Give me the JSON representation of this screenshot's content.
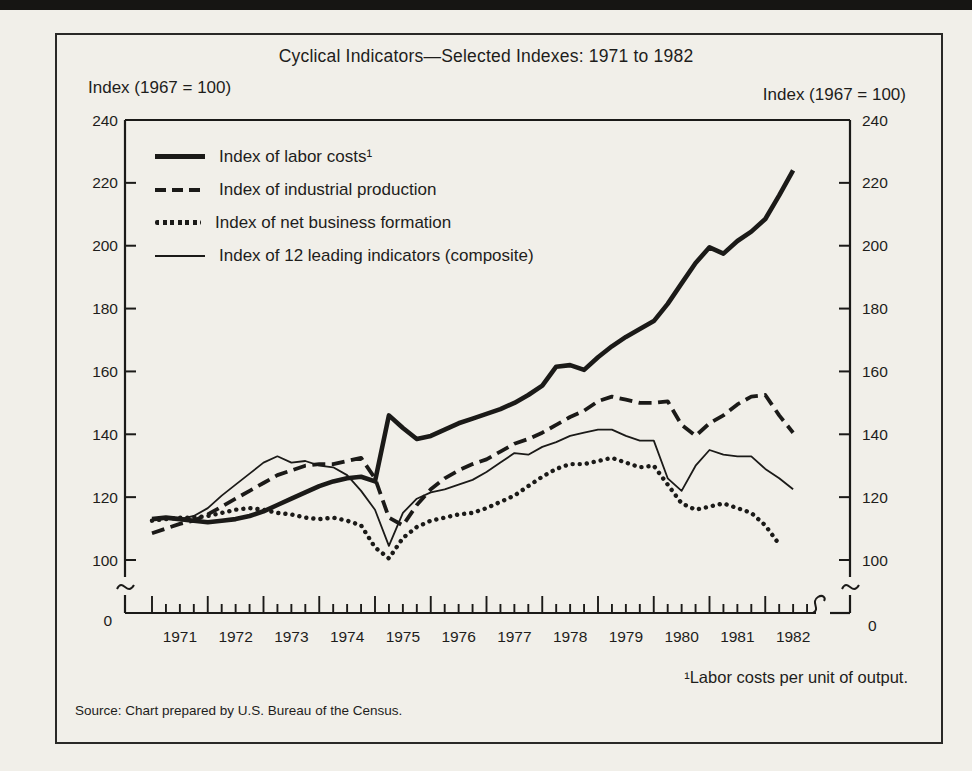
{
  "ink_color": "#1b1a18",
  "paper_color": "#f1efe9",
  "chart": {
    "title": "Cyclical Indicators—Selected Indexes: 1971 to 1982",
    "left_axis_title": "Index (1967 = 100)",
    "right_axis_title": "Index (1967 = 100)",
    "footnote": "¹Labor costs per unit of output.",
    "source": "Source: Chart prepared by U.S. Bureau of the Census."
  },
  "chart_data": {
    "type": "line",
    "title": "Cyclical Indicators—Selected Indexes: 1971 to 1982",
    "ylabel_left": "Index (1967 = 100)",
    "ylabel_right": "Index (1967 = 100)",
    "ylim": [
      100,
      240
    ],
    "y_ticks": [
      100,
      120,
      140,
      160,
      180,
      200,
      220,
      240
    ],
    "broken_y_axis_to_zero": true,
    "zero_label": "0",
    "x_tick_years": [
      "1971",
      "1972",
      "1973",
      "1974",
      "1975",
      "1976",
      "1977",
      "1978",
      "1979",
      "1980",
      "1981",
      "1982"
    ],
    "x_minor_ticks": "quarterly",
    "legend_position": "top-left",
    "grid": false,
    "series": [
      {
        "id": "labor-costs",
        "name": "Index of labor costs¹",
        "style": "thick-solid",
        "x_unit": "year-quarterly",
        "values": [
          [
            1971.0,
            113
          ],
          [
            1971.25,
            113.5
          ],
          [
            1971.5,
            113
          ],
          [
            1971.75,
            112.5
          ],
          [
            1972.0,
            112
          ],
          [
            1972.25,
            112.5
          ],
          [
            1972.5,
            113
          ],
          [
            1972.75,
            114
          ],
          [
            1973.0,
            115.5
          ],
          [
            1973.25,
            117.5
          ],
          [
            1973.5,
            119.5
          ],
          [
            1973.75,
            121.5
          ],
          [
            1974.0,
            123.5
          ],
          [
            1974.25,
            125
          ],
          [
            1974.5,
            126
          ],
          [
            1974.75,
            126.5
          ],
          [
            1975.0,
            125
          ],
          [
            1975.25,
            146
          ],
          [
            1975.5,
            142
          ],
          [
            1975.75,
            138.5
          ],
          [
            1976.0,
            139.5
          ],
          [
            1976.25,
            141.5
          ],
          [
            1976.5,
            143.5
          ],
          [
            1976.75,
            145
          ],
          [
            1977.0,
            146.5
          ],
          [
            1977.25,
            148
          ],
          [
            1977.5,
            150
          ],
          [
            1977.75,
            152.5
          ],
          [
            1978.0,
            155.5
          ],
          [
            1978.25,
            161.5
          ],
          [
            1978.5,
            162
          ],
          [
            1978.75,
            160.5
          ],
          [
            1979.0,
            164.5
          ],
          [
            1979.25,
            168
          ],
          [
            1979.5,
            171
          ],
          [
            1979.75,
            173.5
          ],
          [
            1980.0,
            176
          ],
          [
            1980.25,
            181.5
          ],
          [
            1980.5,
            188
          ],
          [
            1980.75,
            194.5
          ],
          [
            1981.0,
            199.5
          ],
          [
            1981.25,
            197.5
          ],
          [
            1981.5,
            201.5
          ],
          [
            1981.75,
            204.5
          ],
          [
            1982.0,
            208.5
          ],
          [
            1982.25,
            216
          ],
          [
            1982.5,
            224
          ]
        ]
      },
      {
        "id": "industrial-production",
        "name": "Index of industrial production",
        "style": "dashed",
        "x_unit": "year-quarterly",
        "values": [
          [
            1971.0,
            108.5
          ],
          [
            1971.25,
            110
          ],
          [
            1971.5,
            111.5
          ],
          [
            1971.75,
            112.5
          ],
          [
            1972.0,
            114.5
          ],
          [
            1972.25,
            117
          ],
          [
            1972.5,
            119.5
          ],
          [
            1972.75,
            122
          ],
          [
            1973.0,
            124.5
          ],
          [
            1973.25,
            127
          ],
          [
            1973.5,
            128.5
          ],
          [
            1973.75,
            130
          ],
          [
            1974.0,
            130.5
          ],
          [
            1974.25,
            130.5
          ],
          [
            1974.5,
            131.5
          ],
          [
            1974.75,
            132.5
          ],
          [
            1975.0,
            126
          ],
          [
            1975.25,
            113.5
          ],
          [
            1975.5,
            111
          ],
          [
            1975.75,
            117.5
          ],
          [
            1976.0,
            122.5
          ],
          [
            1976.25,
            126
          ],
          [
            1976.5,
            128.5
          ],
          [
            1976.75,
            130.5
          ],
          [
            1977.0,
            132
          ],
          [
            1977.25,
            134.5
          ],
          [
            1977.5,
            137
          ],
          [
            1977.75,
            138.5
          ],
          [
            1978.0,
            140.5
          ],
          [
            1978.25,
            143
          ],
          [
            1978.5,
            145.5
          ],
          [
            1978.75,
            147.5
          ],
          [
            1979.0,
            150.5
          ],
          [
            1979.25,
            152
          ],
          [
            1979.5,
            151
          ],
          [
            1979.75,
            150
          ],
          [
            1980.0,
            150
          ],
          [
            1980.25,
            150.5
          ],
          [
            1980.5,
            143
          ],
          [
            1980.75,
            139.5
          ],
          [
            1981.0,
            143.5
          ],
          [
            1981.25,
            146
          ],
          [
            1981.5,
            149.5
          ],
          [
            1981.75,
            152
          ],
          [
            1982.0,
            152.5
          ],
          [
            1982.25,
            146
          ],
          [
            1982.5,
            140.5
          ]
        ]
      },
      {
        "id": "net-business-formation",
        "name": "Index of net business formation",
        "style": "dotted",
        "x_unit": "year-quarterly",
        "values": [
          [
            1971.0,
            112.5
          ],
          [
            1971.25,
            113
          ],
          [
            1971.5,
            113.5
          ],
          [
            1971.75,
            113.5
          ],
          [
            1972.0,
            114
          ],
          [
            1972.25,
            115
          ],
          [
            1972.5,
            116
          ],
          [
            1972.75,
            116.5
          ],
          [
            1973.0,
            116
          ],
          [
            1973.25,
            115
          ],
          [
            1973.5,
            114.5
          ],
          [
            1973.75,
            113.5
          ],
          [
            1974.0,
            113
          ],
          [
            1974.25,
            113.5
          ],
          [
            1974.5,
            112.5
          ],
          [
            1974.75,
            111
          ],
          [
            1975.0,
            104
          ],
          [
            1975.25,
            100.5
          ],
          [
            1975.5,
            107
          ],
          [
            1975.75,
            110.5
          ],
          [
            1976.0,
            112.5
          ],
          [
            1976.25,
            113.5
          ],
          [
            1976.5,
            114.5
          ],
          [
            1976.75,
            115
          ],
          [
            1977.0,
            116.5
          ],
          [
            1977.25,
            118.5
          ],
          [
            1977.5,
            120.5
          ],
          [
            1977.75,
            123.5
          ],
          [
            1978.0,
            126.5
          ],
          [
            1978.25,
            129
          ],
          [
            1978.5,
            130.5
          ],
          [
            1978.75,
            130.5
          ],
          [
            1979.0,
            131.5
          ],
          [
            1979.25,
            132.5
          ],
          [
            1979.5,
            131
          ],
          [
            1979.75,
            129.5
          ],
          [
            1980.0,
            130
          ],
          [
            1980.25,
            124
          ],
          [
            1980.5,
            118
          ],
          [
            1980.75,
            116
          ],
          [
            1981.0,
            117
          ],
          [
            1981.25,
            118
          ],
          [
            1981.5,
            116.5
          ],
          [
            1981.75,
            115
          ],
          [
            1982.0,
            111
          ],
          [
            1982.25,
            105
          ]
        ]
      },
      {
        "id": "leading-indicators",
        "name": "Index of 12 leading indicators (composite)",
        "style": "thin-solid",
        "x_unit": "year-quarterly",
        "values": [
          [
            1971.0,
            113
          ],
          [
            1971.25,
            113
          ],
          [
            1971.5,
            113
          ],
          [
            1971.75,
            114
          ],
          [
            1972.0,
            116.5
          ],
          [
            1972.25,
            120.5
          ],
          [
            1972.5,
            124
          ],
          [
            1972.75,
            127.5
          ],
          [
            1973.0,
            131
          ],
          [
            1973.25,
            133
          ],
          [
            1973.5,
            131
          ],
          [
            1973.75,
            131.5
          ],
          [
            1974.0,
            130
          ],
          [
            1974.25,
            129.5
          ],
          [
            1974.5,
            127
          ],
          [
            1974.75,
            122
          ],
          [
            1975.0,
            116
          ],
          [
            1975.25,
            104.5
          ],
          [
            1975.5,
            115
          ],
          [
            1975.75,
            119.5
          ],
          [
            1976.0,
            121.5
          ],
          [
            1976.25,
            122.5
          ],
          [
            1976.5,
            124
          ],
          [
            1976.75,
            125.5
          ],
          [
            1977.0,
            128
          ],
          [
            1977.25,
            131
          ],
          [
            1977.5,
            134
          ],
          [
            1977.75,
            133.5
          ],
          [
            1978.0,
            136
          ],
          [
            1978.25,
            137.5
          ],
          [
            1978.5,
            139.5
          ],
          [
            1978.75,
            140.5
          ],
          [
            1979.0,
            141.5
          ],
          [
            1979.25,
            141.5
          ],
          [
            1979.5,
            139.5
          ],
          [
            1979.75,
            138
          ],
          [
            1980.0,
            138
          ],
          [
            1980.25,
            126
          ],
          [
            1980.5,
            122
          ],
          [
            1980.75,
            130
          ],
          [
            1981.0,
            135
          ],
          [
            1981.25,
            133.5
          ],
          [
            1981.5,
            133
          ],
          [
            1981.75,
            133
          ],
          [
            1982.0,
            129
          ],
          [
            1982.25,
            126
          ],
          [
            1982.5,
            122.5
          ]
        ]
      }
    ]
  }
}
